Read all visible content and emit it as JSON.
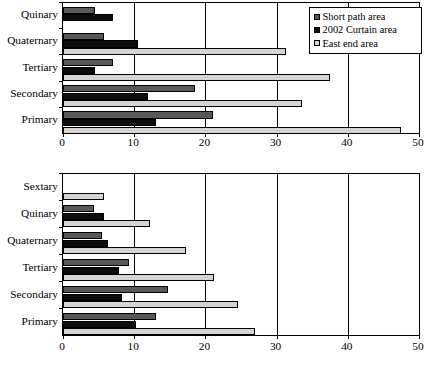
{
  "chart_data": [
    {
      "type": "bar",
      "orientation": "horizontal",
      "id": "top-chart",
      "title": "",
      "xlabel": "",
      "ylabel": "",
      "xlim": [
        0,
        50
      ],
      "xticks": [
        0,
        10,
        20,
        30,
        40,
        50
      ],
      "xtick_labels": [
        "0",
        "10",
        "20",
        "30",
        "40",
        "50"
      ],
      "grid": true,
      "legend_position": "top-right",
      "categories": [
        "Primary",
        "Secondary",
        "Tertiary",
        "Quaternary",
        "Quinary"
      ],
      "series": [
        {
          "name": "Short path area",
          "color": "#58585a",
          "values": [
            21.0,
            18.5,
            7.0,
            5.7,
            4.5
          ]
        },
        {
          "name": "2002 Curtain area",
          "color": "#0d0d0d",
          "values": [
            13.0,
            12.0,
            4.5,
            10.5,
            7.0
          ]
        },
        {
          "name": "East end area",
          "color": "#d4d4d2",
          "values": [
            47.5,
            33.5,
            37.5,
            31.3,
            0.0
          ]
        }
      ]
    },
    {
      "type": "bar",
      "orientation": "horizontal",
      "id": "bottom-chart",
      "title": "",
      "xlabel": "",
      "ylabel": "",
      "xlim": [
        0,
        50
      ],
      "xticks": [
        0,
        10,
        20,
        30,
        40,
        50
      ],
      "xtick_labels": [
        "0",
        "10",
        "20",
        "30",
        "40",
        "50"
      ],
      "grid": true,
      "legend_position": "none",
      "categories": [
        "Primary",
        "Secondary",
        "Tertiary",
        "Quaternary",
        "Quinary",
        "Sextary"
      ],
      "series": [
        {
          "name": "Short path area",
          "color": "#58585a",
          "values": [
            13.0,
            14.8,
            9.3,
            5.5,
            4.3,
            0.0
          ]
        },
        {
          "name": "2002 Curtain area",
          "color": "#0d0d0d",
          "values": [
            10.3,
            8.3,
            7.8,
            6.3,
            5.8,
            0.0
          ]
        },
        {
          "name": "East end area",
          "color": "#d4d4d2",
          "values": [
            27.0,
            24.6,
            21.2,
            17.3,
            12.2,
            5.7
          ]
        }
      ]
    }
  ],
  "legend": {
    "items": [
      {
        "label": "Short path area",
        "color": "#58585a"
      },
      {
        "label": "2002 Curtain area",
        "color": "#0d0d0d"
      },
      {
        "label": "East end area",
        "color": "#d4d4d2"
      }
    ]
  }
}
